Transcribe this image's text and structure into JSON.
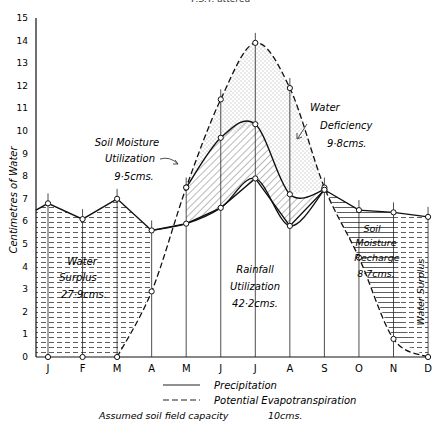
{
  "header": {
    "caption": "P.S.T. attered"
  },
  "chart_data": {
    "type": "line",
    "title": "",
    "xlabel": "",
    "ylabel": "Centimetres of Water",
    "ylim": [
      0,
      15
    ],
    "yticks": [
      0,
      1,
      2,
      3,
      4,
      5,
      6,
      7,
      8,
      9,
      10,
      11,
      12,
      13,
      14,
      15
    ],
    "categories": [
      "J",
      "F",
      "M",
      "A",
      "M",
      "J",
      "J",
      "A",
      "S",
      "O",
      "N",
      "D"
    ],
    "series": [
      {
        "name": "Precipitation",
        "style": "solid",
        "values": [
          6.8,
          6.1,
          7.0,
          5.6,
          5.9,
          6.6,
          7.9,
          5.8,
          7.4,
          6.5,
          6.4,
          6.2
        ]
      },
      {
        "name": "Potential Evapotranspiration",
        "style": "dashed",
        "values": [
          0,
          0,
          0,
          2.9,
          7.5,
          11.4,
          13.9,
          11.9,
          7.5,
          4.4,
          0.8,
          0
        ]
      },
      {
        "name": "Actual Evapotranspiration (Rainfall + Soil Moisture Utilization)",
        "style": "solid",
        "values": [
          null,
          null,
          null,
          null,
          7.5,
          9.7,
          10.3,
          7.2,
          7.4,
          null,
          null,
          null
        ]
      }
    ],
    "annotations": [
      {
        "label": "Water Surplus",
        "value": "27·9cms.",
        "region": "Jan–Apr"
      },
      {
        "label": "Soil Moisture Utilization",
        "value": "9·5cms.",
        "region": "May–Sep"
      },
      {
        "label": "Water Deficiency",
        "value": "9·8cms.",
        "region": "May–Sep"
      },
      {
        "label": "Rainfall Utilization",
        "value": "42·2cms.",
        "region": "Apr–Sep"
      },
      {
        "label": "Soil Moisture Recharge",
        "value": "8·7cms.",
        "region": "Sep–Dec"
      },
      {
        "label": "Water Surplus",
        "value": "",
        "region": "Nov–Dec"
      }
    ],
    "legend": {
      "position": "bottom",
      "items": [
        {
          "label": "Precipitation",
          "style": "solid"
        },
        {
          "label": "Potential Evapotranspiration",
          "style": "dashed"
        }
      ]
    },
    "footnote": {
      "label": "Assumed soil field capacity",
      "value": "10cms."
    },
    "grid": false
  },
  "labels": {
    "surplus1_a": "Water",
    "surplus1_b": "Surplus",
    "surplus1_c": "27·9cms.",
    "smu_a": "Soil Moisture",
    "smu_b": "Utilization",
    "smu_c": "9·5cms.",
    "def_a": "Water",
    "def_b": "Deficiency",
    "def_c": "9·8cms.",
    "ru_a": "Rainfall",
    "ru_b": "Utilization",
    "ru_c": "42·2cms.",
    "smr_a": "Soil",
    "smr_b": "Moisture",
    "smr_c": "Recharge",
    "smr_d": "8·7cms.",
    "surplus2": "Water Surplus",
    "legend_precip": "Precipitation",
    "legend_pe": "Potential Evapotranspiration",
    "footnote_label": "Assumed soil field capacity",
    "footnote_value": "10cms.",
    "ylabel": "Centimetres of Water"
  }
}
